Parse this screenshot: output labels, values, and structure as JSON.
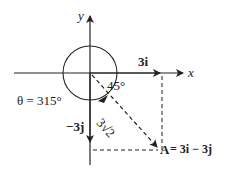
{
  "diagram": {
    "type": "vector-decomposition",
    "axes": {
      "x_label": "x",
      "y_label": "y"
    },
    "components": {
      "i_label": "3i",
      "j_label": "−3j"
    },
    "angle_small": "45°",
    "angle_full": "θ = 315°",
    "magnitude": "3√2",
    "vector": {
      "name": "A",
      "equation": " = 3i − 3j",
      "i_coef": 3,
      "j_coef": -3
    },
    "colors": {
      "stroke": "#222222",
      "background": "#ffffff"
    }
  }
}
